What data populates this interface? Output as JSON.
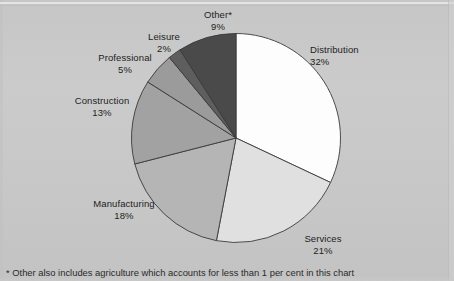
{
  "chart_data": {
    "type": "pie",
    "title": "",
    "subtitle": "",
    "xlabel": "",
    "ylabel": "",
    "legend_position": "none",
    "grid": false,
    "value_unit": "%",
    "start_angle_deg": 0,
    "direction": "clockwise",
    "categories": [
      "Distribution",
      "Services",
      "Manufacturing",
      "Construction",
      "Professional",
      "Leisure",
      "Other*"
    ],
    "values": [
      32,
      21,
      18,
      13,
      5,
      2,
      9
    ],
    "slices": [
      {
        "label": "Distribution",
        "value": 32,
        "value_text": "32%",
        "color": "#fdfdfd"
      },
      {
        "label": "Services",
        "value": 21,
        "value_text": "21%",
        "color": "#e0e0e0"
      },
      {
        "label": "Manufacturing",
        "value": 18,
        "value_text": "18%",
        "color": "#b5b5b5"
      },
      {
        "label": "Construction",
        "value": 13,
        "value_text": "13%",
        "color": "#a2a2a2"
      },
      {
        "label": "Professional",
        "value": 5,
        "value_text": "5%",
        "color": "#9b9b9b"
      },
      {
        "label": "Leisure",
        "value": 2,
        "value_text": "2%",
        "color": "#5e5e5e"
      },
      {
        "label": "Other*",
        "value": 9,
        "value_text": "9%",
        "color": "#4a4a4a"
      }
    ],
    "annotations": [
      "* Other also includes agriculture which accounts for less than 1 per cent in this chart"
    ],
    "colors": {
      "background": "#c9c9c9",
      "outline": "#3a3a3a",
      "text": "#1d1d1d"
    }
  },
  "labels": {
    "distribution": {
      "name": "Distribution",
      "value": "32%"
    },
    "services": {
      "name": "Services",
      "value": "21%"
    },
    "manufacturing": {
      "name": "Manufacturing",
      "value": "18%"
    },
    "construction": {
      "name": "Construction",
      "value": "13%"
    },
    "professional": {
      "name": "Professional",
      "value": "5%"
    },
    "leisure": {
      "name": "Leisure",
      "value": "2%"
    },
    "other": {
      "name": "Other*",
      "value": "9%"
    }
  },
  "footnote": {
    "text": "* Other also includes agriculture which accounts for less than 1 per cent in this chart"
  }
}
